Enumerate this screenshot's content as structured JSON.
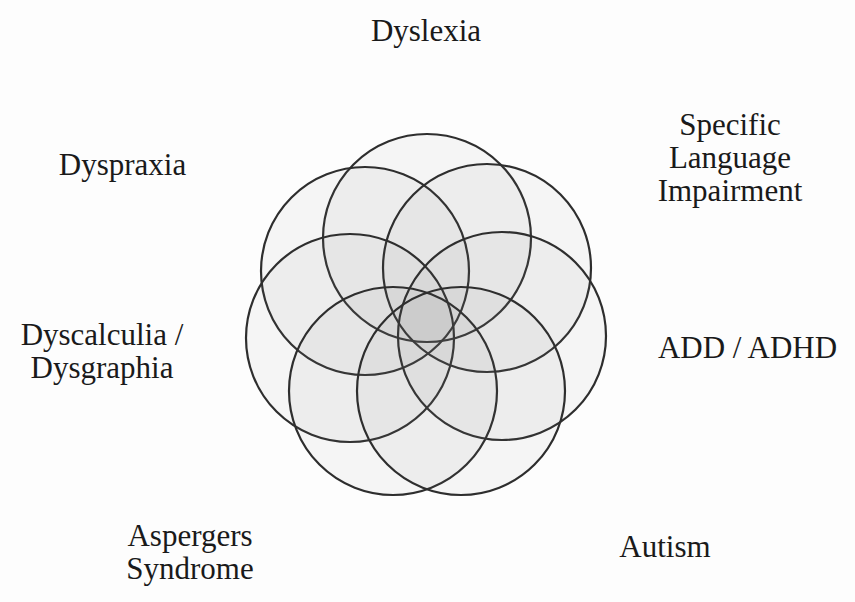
{
  "diagram": {
    "type": "overlapping-circles",
    "stroke_color": "#2e2e2e",
    "fill_color": "rgba(120,120,120,0.06)",
    "radius": 104,
    "circles": [
      {
        "id": "dyslexia",
        "cx": 427,
        "cy": 238
      },
      {
        "id": "dyspraxia",
        "cx": 365,
        "cy": 271
      },
      {
        "id": "sli",
        "cx": 487,
        "cy": 268
      },
      {
        "id": "dyscalculia",
        "cx": 350,
        "cy": 338
      },
      {
        "id": "adhd",
        "cx": 502,
        "cy": 336
      },
      {
        "id": "aspergers",
        "cx": 393,
        "cy": 391
      },
      {
        "id": "autism",
        "cx": 461,
        "cy": 391
      }
    ],
    "labels": {
      "dyslexia": {
        "lines": [
          "Dyslexia"
        ]
      },
      "sli": {
        "lines": [
          "Specific",
          "Language",
          "Impairment"
        ]
      },
      "dyspraxia": {
        "lines": [
          "Dyspraxia"
        ]
      },
      "adhd": {
        "lines": [
          "ADD / ADHD"
        ]
      },
      "dyscalculia": {
        "lines": [
          "Dyscalculia /",
          "Dysgraphia"
        ]
      },
      "aspergers": {
        "lines": [
          "Aspergers",
          "Syndrome"
        ]
      },
      "autism": {
        "lines": [
          "Autism"
        ]
      }
    }
  }
}
